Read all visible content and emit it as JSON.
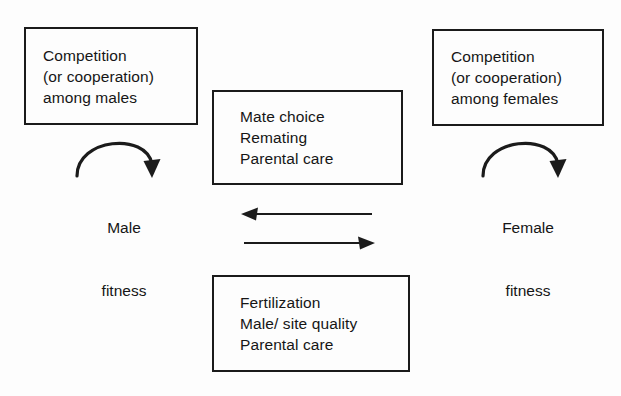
{
  "diagram": {
    "background_color": "#fdfdfd",
    "line_color": "#1b1b1b",
    "boxes": {
      "male_competition": {
        "name": "Competition (or cooperation) among males",
        "lines": [
          "Competition",
          "(or cooperation)",
          "among males"
        ]
      },
      "female_competition": {
        "name": "Competition (or cooperation) among females",
        "lines": [
          "Competition",
          "(or cooperation)",
          "among females"
        ]
      },
      "female_traits": {
        "name": "Female mate decisions",
        "lines": [
          "Mate choice",
          "Remating",
          "Parental care"
        ]
      },
      "male_traits": {
        "name": "Male contributions",
        "lines": [
          "Fertilization",
          "Male/ site quality",
          "Parental care"
        ]
      }
    },
    "labels": {
      "male_fitness": [
        "Male",
        "fitness"
      ],
      "female_fitness": [
        "Female",
        "fitness"
      ]
    },
    "arrows": {
      "male_loop": "curved arrow from male competition box down to male fitness",
      "female_loop": "curved arrow from female competition box down to female fitness",
      "upper_middle": "arrow pointing left",
      "lower_middle": "arrow pointing right"
    }
  }
}
